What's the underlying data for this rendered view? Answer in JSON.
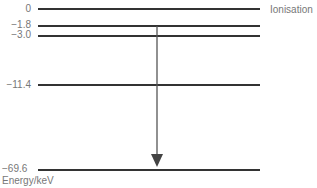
{
  "diagram": {
    "axis_label": "Energy/keV",
    "levels": [
      {
        "value": "0",
        "y": 9,
        "note": "Ionisation"
      },
      {
        "value": "−1.8",
        "y": 26,
        "note": ""
      },
      {
        "value": "−3.0",
        "y": 36,
        "note": ""
      },
      {
        "value": "−11.4",
        "y": 85,
        "note": ""
      },
      {
        "value": "−69.6",
        "y": 170,
        "note": ""
      }
    ],
    "transition": {
      "from": "−1.8",
      "to": "−69.6",
      "x": 157,
      "color": "#555555"
    },
    "colors": {
      "line": "#333333",
      "text": "#777777"
    }
  }
}
